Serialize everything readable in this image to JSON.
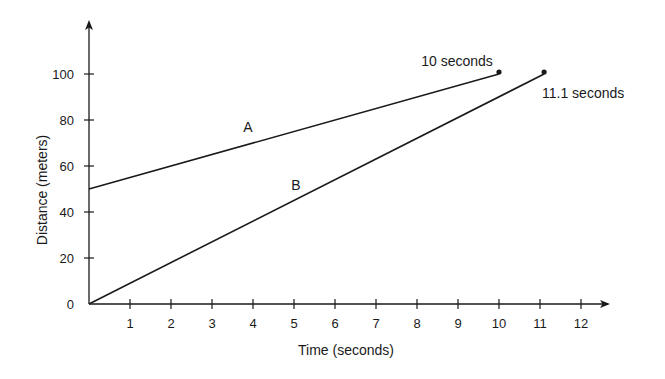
{
  "chart_data": {
    "type": "line",
    "title": "",
    "xlabel": "Time (seconds)",
    "ylabel": "Distance (meters)",
    "xlim": [
      0,
      12.7
    ],
    "ylim": [
      0,
      115
    ],
    "grid": false,
    "legend": "none (inline line labels)",
    "x_ticks": [
      "1",
      "2",
      "3",
      "4",
      "5",
      "6",
      "7",
      "8",
      "9",
      "10",
      "11",
      "12"
    ],
    "y_ticks": [
      "0",
      "20",
      "40",
      "60",
      "80",
      "100"
    ],
    "series": [
      {
        "name": "A",
        "x": [
          0,
          10
        ],
        "y": [
          50,
          100
        ],
        "end_marker": true,
        "end_annotation": "10 seconds"
      },
      {
        "name": "B",
        "x": [
          0,
          11.1
        ],
        "y": [
          0,
          100
        ],
        "end_marker": true,
        "end_annotation": "11.1 seconds"
      }
    ],
    "annotations": [
      "A",
      "B",
      "10 seconds",
      "11.1 seconds"
    ]
  },
  "labels": {
    "xlabel": "Time (seconds)",
    "ylabel": "Distance (meters)",
    "line_a": "A",
    "line_b": "B",
    "end_a": "10 seconds",
    "end_b": "11.1 seconds"
  },
  "colors": {
    "ink": "#1a1a1a",
    "background": "#ffffff"
  }
}
